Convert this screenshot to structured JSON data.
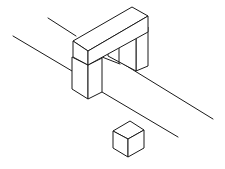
{
  "figure": {
    "stroke_color": "#1a1a1a",
    "background": "#ffffff",
    "elements": [
      {
        "name": "arch",
        "parts": [
          "lintel",
          "left-pillar",
          "right-pillar"
        ]
      },
      {
        "name": "ground-strip",
        "lines": 4
      },
      {
        "name": "cube"
      }
    ]
  }
}
